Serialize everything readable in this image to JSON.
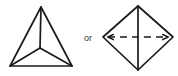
{
  "figure": {
    "background_color": "#ffffff",
    "stroke_color": "#1a1a1a",
    "separator_text": "or",
    "separator_color": "#3c3c3c",
    "left_figure": {
      "name": "triangle-with-center-spokes",
      "stroke_width": 1.6,
      "outline": [
        {
          "x": 41,
          "y": 7
        },
        {
          "x": 10,
          "y": 66
        },
        {
          "x": 72,
          "y": 66
        }
      ],
      "center_point": {
        "x": 40,
        "y": 48
      },
      "spokes": [
        {
          "from": {
            "x": 40,
            "y": 48
          },
          "to": {
            "x": 41,
            "y": 7
          },
          "style": "solid"
        },
        {
          "from": {
            "x": 40,
            "y": 48
          },
          "to": {
            "x": 10,
            "y": 66
          },
          "style": "solid"
        },
        {
          "from": {
            "x": 40,
            "y": 48
          },
          "to": {
            "x": 72,
            "y": 66
          },
          "style": "solid"
        }
      ]
    },
    "right_figure": {
      "name": "diamond-with-axes",
      "stroke_width": 1.6,
      "outline": [
        {
          "x": 138,
          "y": 6
        },
        {
          "x": 103,
          "y": 37
        },
        {
          "x": 138,
          "y": 70
        },
        {
          "x": 173,
          "y": 37
        }
      ],
      "vertical_axis": {
        "from": {
          "x": 138,
          "y": 6
        },
        "to": {
          "x": 138,
          "y": 70
        },
        "style": "solid"
      },
      "horizontal_axis": {
        "from": {
          "x": 103,
          "y": 37
        },
        "to": {
          "x": 173,
          "y": 37
        },
        "style": "dashed",
        "dash_pattern": "7 5",
        "arrowheads": [
          "start",
          "end"
        ]
      }
    }
  }
}
